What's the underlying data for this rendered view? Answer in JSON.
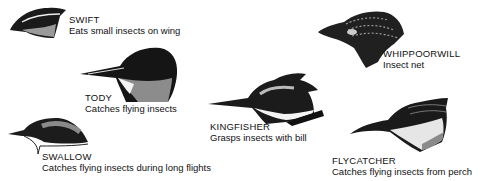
{
  "birds": [
    {
      "name": "SWIFT",
      "description": "Eats small insects on wing"
    },
    {
      "name": "TODY",
      "description": "Catches flying insects"
    },
    {
      "name": "SWALLOW",
      "description": "Catches flying insects during long flights"
    },
    {
      "name": "KINGFISHER",
      "description": "Grasps insects with bill"
    },
    {
      "name": "WHIPPOORWILL",
      "description": "Insect net"
    },
    {
      "name": "FLYCATCHER",
      "description": "Catches flying insects from perch"
    }
  ]
}
